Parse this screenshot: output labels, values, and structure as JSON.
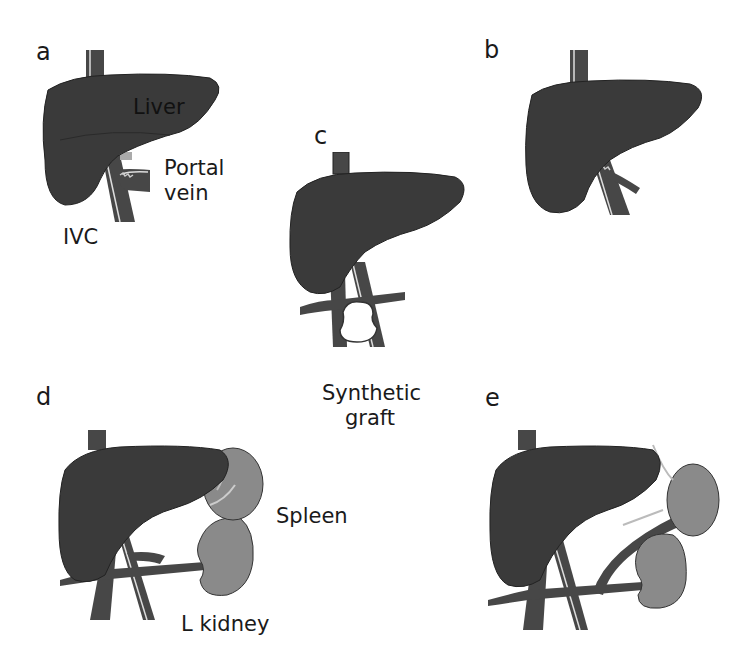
{
  "figure": {
    "panels": [
      {
        "id": "a",
        "letter": "a",
        "labels": {
          "liver": "Liver",
          "portal_vein": "Portal\nvein",
          "ivc": "IVC"
        }
      },
      {
        "id": "b",
        "letter": "b"
      },
      {
        "id": "c",
        "letter": "c"
      },
      {
        "id": "d",
        "letter": "d",
        "labels": {
          "spleen": "Spleen",
          "kidney": "L kidney"
        }
      },
      {
        "id": "e",
        "letter": "e"
      }
    ],
    "shared_labels": {
      "synthetic_graft": "Synthetic graft"
    },
    "colors": {
      "liver": "#3a3a3a",
      "vessel": "#474747",
      "organ_gray": "#8a8a8a",
      "background": "#ffffff"
    }
  },
  "text": {
    "a": "a",
    "b": "b",
    "c": "c",
    "d": "d",
    "e": "e",
    "liver": "Liver",
    "portal": "Portal",
    "vein": "vein",
    "ivc": "IVC",
    "synthetic": "Synthetic",
    "graft": "graft",
    "spleen": "Spleen",
    "kidney": "L kidney"
  }
}
